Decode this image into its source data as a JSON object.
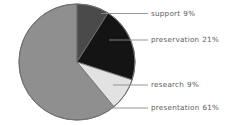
{
  "chart_data": {
    "type": "pie",
    "title": "",
    "subtitle": "",
    "xlabel": "",
    "ylabel": "",
    "legend_position": "right-callout-labels",
    "grid": false,
    "start_angle_deg": 0,
    "direction": "clockwise",
    "categories": [
      "support",
      "preservation",
      "research",
      "presentation"
    ],
    "values": [
      9,
      21,
      9,
      61
    ],
    "value_unit": "%",
    "labels": [
      "support  9%",
      "preservation  21%",
      "research  9%",
      "presentation  61%"
    ],
    "colors": [
      "#4a4a4a",
      "#141414",
      "#e2e2e2",
      "#8f8f8f"
    ],
    "slices": [
      {
        "name": "support",
        "value": 9,
        "value_label": "9%",
        "color": "#4a4a4a",
        "start_deg": 0,
        "end_deg": 32.4
      },
      {
        "name": "preservation",
        "value": 21,
        "value_label": "21%",
        "color": "#141414",
        "start_deg": 32.4,
        "end_deg": 108.0
      },
      {
        "name": "research",
        "value": 9,
        "value_label": "9%",
        "color": "#e2e2e2",
        "start_deg": 108.0,
        "end_deg": 140.4
      },
      {
        "name": "presentation",
        "value": 61,
        "value_label": "61%",
        "color": "#8f8f8f",
        "start_deg": 140.4,
        "end_deg": 360.0
      }
    ]
  },
  "chart": {
    "background": "#ffffff",
    "outline_color": "#6f6f6f",
    "leader_color": "#8a8a8a",
    "text_color": "#5a5a5a",
    "center_x": 77,
    "center_y": 62,
    "radius": 58
  },
  "labels": {
    "support": {
      "name": "support",
      "value": "9%"
    },
    "preservation": {
      "name": "preservation",
      "value": "21%"
    },
    "research": {
      "name": "research",
      "value": "9%"
    },
    "presentation": {
      "name": "presentation",
      "value": "61%"
    }
  }
}
